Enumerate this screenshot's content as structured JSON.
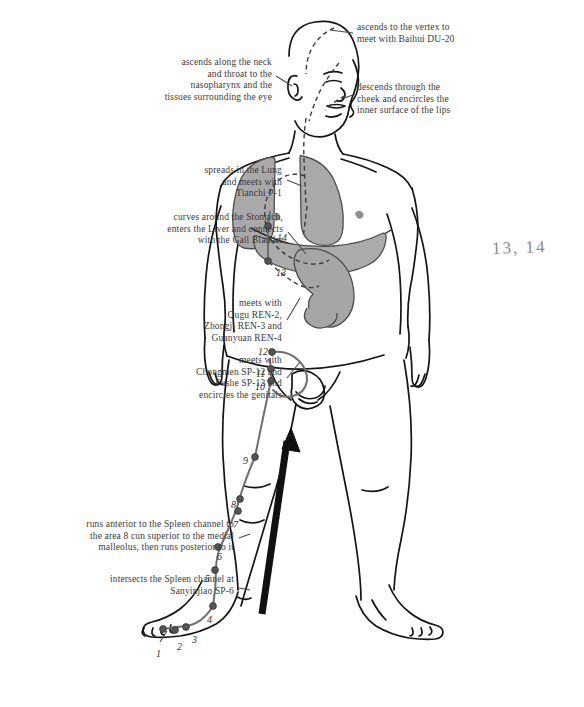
{
  "figure": {
    "background_color": "#ffffff",
    "ink_color": "#1a1a1a",
    "channel_color": "#6f6f6f",
    "organ_fill": "#a8a8a8",
    "organ_stroke": "#4a4a4a",
    "point_color": "#555555",
    "arrow_color": "#111111"
  },
  "annotations": [
    {
      "id": "vertex-baihui",
      "text": "ascends to the vertex to\nmeet with Baihui DU-20",
      "align": "left",
      "x": 357,
      "y": 22,
      "width": 170
    },
    {
      "id": "neck-throat-nasopharynx",
      "text": "ascends along the neck\nand throat to the\nnasopharynx and the\ntissues surrounding the eye",
      "align": "right",
      "x": 120,
      "y": 57,
      "width": 152
    },
    {
      "id": "cheek-lips",
      "text": "descends through the\ncheek and encircles the\ninner surface of the lips",
      "align": "left",
      "x": 357,
      "y": 82,
      "width": 165
    },
    {
      "id": "lung-tianchi",
      "text": "spreads in the Lung\nand meets with\nTianchi P-1",
      "align": "right",
      "x": 110,
      "y": 165,
      "width": 172
    },
    {
      "id": "stomach-liver-gallbladder",
      "text": "curves around the Stomach,\nenters the Liver and connects\nwith the Gall Bladder",
      "align": "right",
      "x": 78,
      "y": 212,
      "width": 205
    },
    {
      "id": "ren-points",
      "text": "meets with\nQugu REN-2,\nZhongji REN-3 and\nGuanyuan REN-4",
      "align": "right",
      "x": 130,
      "y": 298,
      "width": 152
    },
    {
      "id": "sp-points-genitals",
      "text": "meets with\nChongmen SP-12 and\nFushe SP-13 and\nencircles the genitals",
      "align": "right",
      "x": 120,
      "y": 355,
      "width": 162
    },
    {
      "id": "spleen-channel-malleolus",
      "text": "runs anterior to the Spleen channel to\nthe area 8 cun superior to the medial\nmalleolus, then runs posterior to it",
      "align": "right",
      "x": 22,
      "y": 519,
      "width": 212
    },
    {
      "id": "sanyinjiao",
      "text": "intersects the Spleen channel at\nSanyinjiao SP-6",
      "align": "right",
      "x": 48,
      "y": 574,
      "width": 186
    }
  ],
  "hand_note": {
    "text": "13, 14",
    "x": 492,
    "y": 238
  },
  "points": [
    {
      "label": "1",
      "x": 156,
      "y": 648,
      "dot_x": 163,
      "dot_y": 629
    },
    {
      "label": "2",
      "x": 177,
      "y": 641,
      "dot_x": 175,
      "dot_y": 630
    },
    {
      "label": "3",
      "x": 192,
      "y": 634,
      "dot_x": 186,
      "dot_y": 627
    },
    {
      "label": "4",
      "x": 207,
      "y": 614,
      "dot_x": 213,
      "dot_y": 606
    },
    {
      "label": "5",
      "x": 205,
      "y": 573,
      "dot_x": 215,
      "dot_y": 570
    },
    {
      "label": "6",
      "x": 217,
      "y": 551,
      "dot_x": 218,
      "dot_y": 547
    },
    {
      "label": "7",
      "x": 233,
      "y": 519,
      "dot_x": 238,
      "dot_y": 511
    },
    {
      "label": "8",
      "x": 231,
      "y": 499,
      "dot_x": 240,
      "dot_y": 499
    },
    {
      "label": "9",
      "x": 243,
      "y": 455,
      "dot_x": 255,
      "dot_y": 457
    },
    {
      "label": "10",
      "x": 255,
      "y": 381,
      "dot_x": 271,
      "dot_y": 381
    },
    {
      "label": "11",
      "x": 256,
      "y": 368,
      "dot_x": 271,
      "dot_y": 369
    },
    {
      "label": "12",
      "x": 258,
      "y": 346,
      "dot_x": 272,
      "dot_y": 352
    },
    {
      "label": "13",
      "x": 276,
      "y": 267,
      "dot_x": 268,
      "dot_y": 261
    },
    {
      "label": "14",
      "x": 277,
      "y": 232,
      "dot_x": 268,
      "dot_y": 226
    }
  ],
  "organs": [
    {
      "name": "lung-right",
      "fill": "#a9a9a9"
    },
    {
      "name": "lung-left",
      "fill": "#a9a9a9"
    },
    {
      "name": "liver",
      "fill": "#ababab"
    },
    {
      "name": "stomach",
      "fill": "#a6a6a6"
    }
  ],
  "direction_arrow": {
    "name": "flow-direction-arrow",
    "from_x": 262,
    "from_y": 614,
    "to_x": 291,
    "to_y": 428
  }
}
